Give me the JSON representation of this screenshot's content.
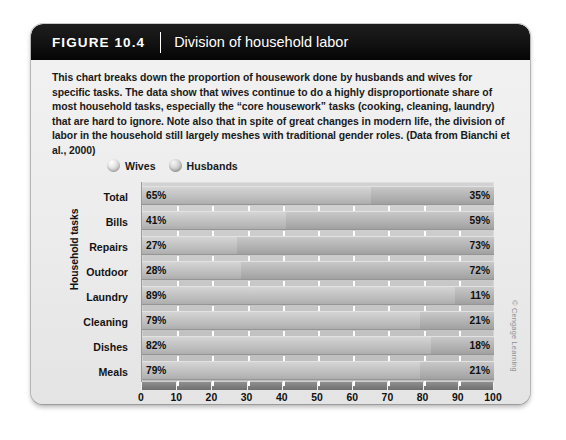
{
  "figure": {
    "label": "FIGURE 10.4",
    "title": "Division of household labor",
    "caption": "This chart breaks down the proportion of housework done by husbands and wives for specific tasks. The data show that wives continue to do a highly disproportionate share of most household tasks, especially the “core housework” tasks (cooking, cleaning, laundry) that are hard to ignore. Note also that in spite of great changes in modern life, the division of labor in the household still largely meshes with traditional gender roles. (Data from Bianchi et al., 2000)",
    "copyright": "© Cengage Learning"
  },
  "chart_data": {
    "type": "bar",
    "orientation": "horizontal",
    "stacked": true,
    "title": "Division of household labor",
    "xlabel": "Percentage of chores done by husbands and wives",
    "ylabel": "Household tasks",
    "xlim": [
      0,
      100
    ],
    "xticks": [
      0,
      10,
      20,
      30,
      40,
      50,
      60,
      70,
      80,
      90,
      100
    ],
    "xtick_labels": [
      "0",
      "10",
      "20",
      "30",
      "40",
      "50",
      "60",
      "70",
      "80",
      "90",
      "100"
    ],
    "grid": false,
    "legend_position": "top-left",
    "categories": [
      "Total",
      "Bills",
      "Repairs",
      "Outdoor",
      "Laundry",
      "Cleaning",
      "Dishes",
      "Meals"
    ],
    "series": [
      {
        "name": "Wives",
        "values": [
          65,
          41,
          27,
          28,
          89,
          79,
          82,
          79
        ],
        "labels": [
          "65%",
          "41%",
          "27%",
          "28%",
          "89%",
          "79%",
          "82%",
          "79%"
        ],
        "color": "#c9c9c9"
      },
      {
        "name": "Husbands",
        "values": [
          35,
          59,
          73,
          72,
          11,
          21,
          18,
          21
        ],
        "labels": [
          "35%",
          "59%",
          "73%",
          "72%",
          "11%",
          "21%",
          "18%",
          "21%"
        ],
        "color": "#b0b0b0"
      }
    ]
  },
  "legend": {
    "items": [
      {
        "label": "Wives",
        "marker": "sphere-icon"
      },
      {
        "label": "Husbands",
        "marker": "sphere-icon"
      }
    ]
  }
}
